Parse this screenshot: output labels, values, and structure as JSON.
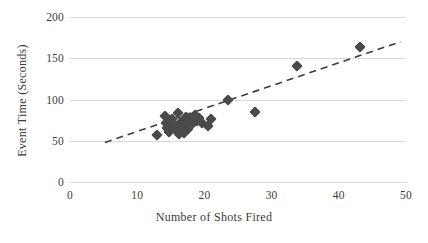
{
  "chart_data": {
    "type": "scatter",
    "title": "",
    "xlabel": "Number of Shots Fired",
    "ylabel": "Event Time (Seconds)",
    "xlim": [
      0,
      50
    ],
    "ylim": [
      0,
      200
    ],
    "xticks": [
      0,
      10,
      20,
      30,
      40,
      50
    ],
    "yticks": [
      0,
      50,
      100,
      150,
      200
    ],
    "xtick_labels": [
      "0",
      "10",
      "20",
      "30",
      "40",
      "50"
    ],
    "ytick_labels": [
      "0",
      "50",
      "100",
      "150",
      "200"
    ],
    "grid": "horizontal",
    "legend": "none",
    "marker": "diamond",
    "marker_color": "#4a4a4a",
    "gridline_color": "#d9d9d9",
    "points": [
      {
        "x": 13.0,
        "y": 57
      },
      {
        "x": 14.2,
        "y": 80
      },
      {
        "x": 14.3,
        "y": 72
      },
      {
        "x": 14.5,
        "y": 66
      },
      {
        "x": 14.8,
        "y": 61
      },
      {
        "x": 15.2,
        "y": 76
      },
      {
        "x": 15.5,
        "y": 69
      },
      {
        "x": 15.8,
        "y": 63
      },
      {
        "x": 16.0,
        "y": 84
      },
      {
        "x": 16.2,
        "y": 58
      },
      {
        "x": 16.5,
        "y": 73
      },
      {
        "x": 16.7,
        "y": 66
      },
      {
        "x": 16.9,
        "y": 60
      },
      {
        "x": 17.2,
        "y": 79
      },
      {
        "x": 17.4,
        "y": 70
      },
      {
        "x": 17.6,
        "y": 64
      },
      {
        "x": 18.0,
        "y": 77
      },
      {
        "x": 18.3,
        "y": 71
      },
      {
        "x": 18.6,
        "y": 81
      },
      {
        "x": 18.9,
        "y": 74
      },
      {
        "x": 19.2,
        "y": 78
      },
      {
        "x": 19.6,
        "y": 72
      },
      {
        "x": 20.6,
        "y": 68
      },
      {
        "x": 21.0,
        "y": 76
      },
      {
        "x": 23.5,
        "y": 100
      },
      {
        "x": 27.5,
        "y": 85
      },
      {
        "x": 33.8,
        "y": 141
      },
      {
        "x": 43.2,
        "y": 164
      }
    ],
    "trendline": {
      "style": "dashed",
      "color": "#3d3d3d",
      "x_start": 5.2,
      "y_start": 48,
      "x_end": 49.2,
      "y_end": 170
    }
  }
}
